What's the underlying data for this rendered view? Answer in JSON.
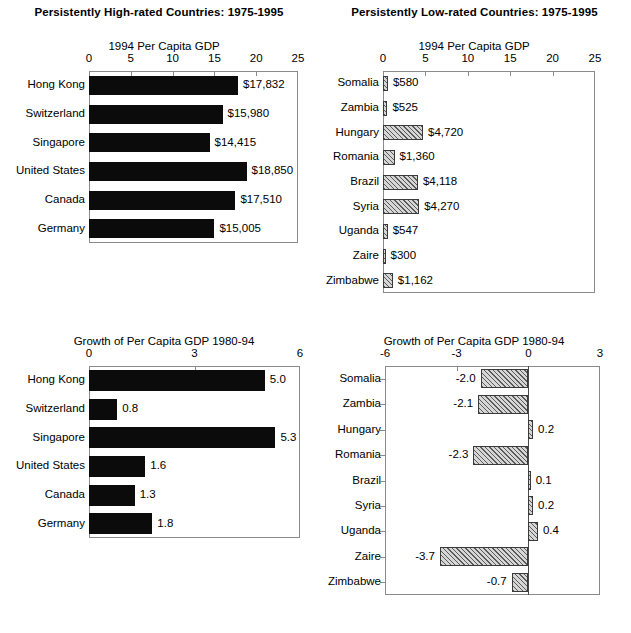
{
  "page": {
    "background": "#ffffff",
    "bar_solid_color": "#0b0b0b",
    "bar_hatch_color": "#d6d6d6",
    "axis_color": "#8a8a8a"
  },
  "panels": {
    "high_gdp": {
      "title": "Persistently High-rated Countries:  1975-1995",
      "axis_title": "1994 Per Capita GDP"
    },
    "low_gdp": {
      "title": "Persistently Low-rated Countries:  1975-1995",
      "axis_title": "1994 Per Capita GDP"
    },
    "high_growth": {
      "axis_title": "Growth of Per Capita GDP 1980-94"
    },
    "low_growth": {
      "axis_title": "Growth of Per Capita GDP 1980-94"
    }
  },
  "chart_data": [
    {
      "id": "high_gdp",
      "type": "bar",
      "orientation": "horizontal",
      "title": "Persistently High-rated Countries:  1975-1995",
      "xlabel": "1994 Per Capita GDP",
      "ylabel": "",
      "xlim": [
        0,
        25
      ],
      "xticks": [
        0,
        5,
        10,
        15,
        20,
        25
      ],
      "xticklabels": [
        "0",
        "5",
        "10",
        "15",
        "20",
        "25"
      ],
      "units": "thousands of US dollars",
      "grid": false,
      "legend": false,
      "fill": "solid-black",
      "categories": [
        "Hong Kong",
        "Switzerland",
        "Singapore",
        "United States",
        "Canada",
        "Germany"
      ],
      "values": [
        17.832,
        15.98,
        14.415,
        18.85,
        17.51,
        15.005
      ],
      "data_labels": [
        "$17,832",
        "$15,980",
        "$14,415",
        "$18,850",
        "$17,510",
        "$15,005"
      ]
    },
    {
      "id": "low_gdp",
      "type": "bar",
      "orientation": "horizontal",
      "title": "Persistently Low-rated Countries:  1975-1995",
      "xlabel": "1994 Per Capita GDP",
      "ylabel": "",
      "xlim": [
        0,
        25
      ],
      "xticks": [
        0,
        5,
        10,
        15,
        20,
        25
      ],
      "xticklabels": [
        "0",
        "5",
        "10",
        "15",
        "20",
        "25"
      ],
      "units": "thousands of US dollars",
      "grid": false,
      "legend": false,
      "fill": "diagonal-hatch",
      "categories": [
        "Somalia",
        "Zambia",
        "Hungary",
        "Romania",
        "Brazil",
        "Syria",
        "Uganda",
        "Zaire",
        "Zimbabwe"
      ],
      "values": [
        0.58,
        0.525,
        4.72,
        1.36,
        4.118,
        4.27,
        0.547,
        0.3,
        1.162
      ],
      "data_labels": [
        "$580",
        "$525",
        "$4,720",
        "$1,360",
        "$4,118",
        "$4,270",
        "$547",
        "$300",
        "$1,162"
      ]
    },
    {
      "id": "high_growth",
      "type": "bar",
      "orientation": "horizontal",
      "title": "",
      "xlabel": "Growth of Per Capita GDP 1980-94",
      "ylabel": "",
      "xlim": [
        0,
        6
      ],
      "xticks": [
        0,
        3,
        6
      ],
      "xticklabels": [
        "0",
        "3",
        "6"
      ],
      "units": "percent per year",
      "grid": false,
      "legend": false,
      "fill": "solid-black",
      "categories": [
        "Hong Kong",
        "Switzerland",
        "Singapore",
        "United States",
        "Canada",
        "Germany"
      ],
      "values": [
        5.0,
        0.8,
        5.3,
        1.6,
        1.3,
        1.8
      ],
      "data_labels": [
        "5.0",
        "0.8",
        "5.3",
        "1.6",
        "1.3",
        "1.8"
      ]
    },
    {
      "id": "low_growth",
      "type": "bar",
      "orientation": "horizontal",
      "title": "",
      "xlabel": "Growth of Per Capita GDP 1980-94",
      "ylabel": "",
      "xlim": [
        -6,
        3
      ],
      "xticks": [
        -6,
        -3,
        0,
        3
      ],
      "xticklabels": [
        "-6",
        "-3",
        "0",
        "3"
      ],
      "units": "percent per year",
      "grid": false,
      "legend": false,
      "fill": "diagonal-hatch",
      "categories": [
        "Somalia",
        "Zambia",
        "Hungary",
        "Romania",
        "Brazil",
        "Syria",
        "Uganda",
        "Zaire",
        "Zimbabwe"
      ],
      "values": [
        -2.0,
        -2.1,
        0.2,
        -2.3,
        0.1,
        0.2,
        0.4,
        -3.7,
        -0.7
      ],
      "data_labels": [
        "-2.0",
        "-2.1",
        "0.2",
        "-2.3",
        "0.1",
        "0.2",
        "0.4",
        "-3.7",
        "-0.7"
      ]
    }
  ]
}
